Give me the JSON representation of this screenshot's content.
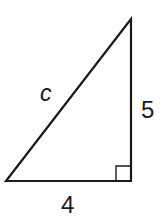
{
  "diagram": {
    "type": "right-triangle",
    "hypotenuse_label": "c",
    "vertical_leg_label": "5",
    "horizontal_leg_label": "4",
    "right_angle_marker": true,
    "stroke_color": "#1a1a1a",
    "background": "#ffffff"
  }
}
